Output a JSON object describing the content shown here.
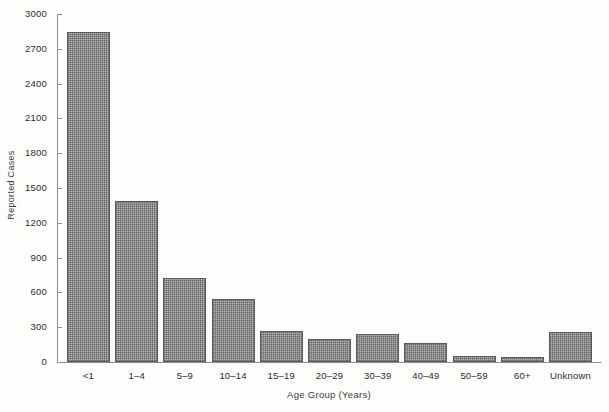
{
  "chart_data": {
    "type": "bar",
    "title": "",
    "xlabel": "Age Group (Years)",
    "ylabel": "Reported Cases",
    "categories": [
      "<1",
      "1–4",
      "5–9",
      "10–14",
      "15–19",
      "20–29",
      "30–39",
      "40–49",
      "50–59",
      "60+",
      "Unknown"
    ],
    "values": [
      2845,
      1390,
      725,
      545,
      265,
      195,
      240,
      165,
      50,
      40,
      255
    ],
    "ylim": [
      0,
      3000
    ],
    "ytick_labels": [
      "0",
      "300",
      "600",
      "900",
      "1200",
      "1500",
      "1800",
      "2100",
      "2400",
      "2700",
      "3000"
    ],
    "ytick_values": [
      0,
      300,
      600,
      900,
      1200,
      1500,
      1800,
      2100,
      2400,
      2700,
      3000
    ],
    "grid": false,
    "legend": "none",
    "bar_fill_color": "#b9b9b9",
    "bar_edge_color": "#5a5a5a",
    "axis_color": "#8d8d8d",
    "background_color": "#fdfdfc"
  }
}
